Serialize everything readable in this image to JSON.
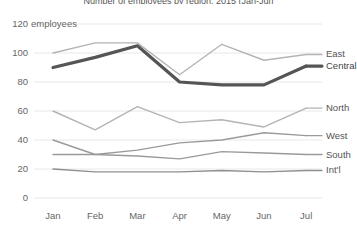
{
  "chart_data": {
    "type": "line",
    "title": "Number of employees by region, 2015 (Jan-Jul)",
    "xlabel": "",
    "ylabel": "employees",
    "unit_label": "employees",
    "categories": [
      "Jan",
      "Feb",
      "Mar",
      "Apr",
      "May",
      "Jun",
      "Jul"
    ],
    "x": [
      "Jan",
      "Feb",
      "Mar",
      "Apr",
      "May",
      "Jun",
      "Jul"
    ],
    "ylim": [
      0,
      120
    ],
    "yticks": [
      0,
      20,
      40,
      60,
      80,
      100,
      120
    ],
    "ytick_labels": [
      "0",
      "20",
      "40",
      "60",
      "80",
      "100",
      "120"
    ],
    "grid": true,
    "grid_axis": "y",
    "legend": "right-inline-labels",
    "series": [
      {
        "name": "East",
        "values": [
          100,
          107,
          107,
          85,
          106,
          95,
          99
        ],
        "color": "#b4b4b4",
        "width": 1.4,
        "emphasis": false
      },
      {
        "name": "Central",
        "values": [
          90,
          97,
          105,
          80,
          78,
          78,
          91
        ],
        "color": "#555555",
        "width": 3.2,
        "emphasis": true
      },
      {
        "name": "North",
        "values": [
          60,
          47,
          63,
          52,
          54,
          49,
          62
        ],
        "color": "#b4b4b4",
        "width": 1.4,
        "emphasis": false
      },
      {
        "name": "West",
        "values": [
          40,
          30,
          33,
          38,
          40,
          45,
          43
        ],
        "color": "#9a9a9a",
        "width": 1.4,
        "emphasis": false
      },
      {
        "name": "South",
        "values": [
          30,
          30,
          29,
          27,
          32,
          31,
          30
        ],
        "color": "#9a9a9a",
        "width": 1.4,
        "emphasis": false
      },
      {
        "name": "Int'l",
        "values": [
          20,
          18,
          18,
          18,
          19,
          18,
          19
        ],
        "color": "#8f8f8f",
        "width": 1.4,
        "emphasis": false
      }
    ]
  },
  "colors": {
    "background": "#ffffff",
    "gridline": "#e8e8e8",
    "axis_text": "#666666",
    "emphasis_series": "#555555",
    "muted_series": "#b4b4b4"
  },
  "axis": {
    "y_unit_suffix": "employees"
  }
}
